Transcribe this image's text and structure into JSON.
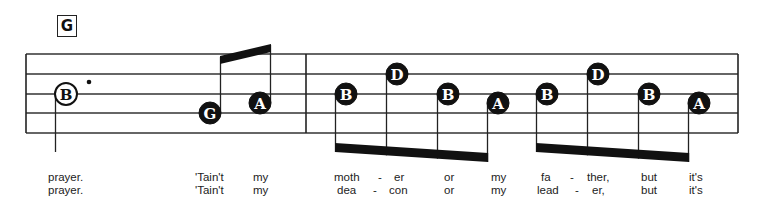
{
  "chord": {
    "label": "G"
  },
  "staff": {
    "lines_y": [
      54,
      74,
      94,
      113,
      133
    ],
    "left_x": 26,
    "barline_x": 306,
    "right_x": 738,
    "color": "#333333"
  },
  "notes": [
    {
      "letter": "B",
      "x": 66,
      "y": 94,
      "filled": false,
      "dotted": true,
      "stem": "down"
    },
    {
      "letter": "G",
      "x": 210,
      "y": 113,
      "filled": true,
      "stem": "up"
    },
    {
      "letter": "A",
      "x": 260,
      "y": 103,
      "filled": true,
      "stem": "up"
    },
    {
      "letter": "B",
      "x": 346,
      "y": 94,
      "filled": true,
      "stem": "down"
    },
    {
      "letter": "D",
      "x": 397,
      "y": 74,
      "filled": true,
      "stem": "down"
    },
    {
      "letter": "B",
      "x": 448,
      "y": 94,
      "filled": true,
      "stem": "down"
    },
    {
      "letter": "A",
      "x": 498,
      "y": 103,
      "filled": true,
      "stem": "down"
    },
    {
      "letter": "B",
      "x": 547,
      "y": 94,
      "filled": true,
      "stem": "down"
    },
    {
      "letter": "D",
      "x": 598,
      "y": 74,
      "filled": true,
      "stem": "down"
    },
    {
      "letter": "B",
      "x": 649,
      "y": 94,
      "filled": true,
      "stem": "down"
    },
    {
      "letter": "A",
      "x": 699,
      "y": 103,
      "filled": true,
      "stem": "down"
    }
  ],
  "lyrics": {
    "line1": [
      {
        "text": "prayer.",
        "x": 48
      },
      {
        "text": "'Tain't",
        "x": 195
      },
      {
        "text": "my",
        "x": 253
      },
      {
        "text": "moth",
        "x": 334
      },
      {
        "text": "-",
        "x": 378
      },
      {
        "text": "er",
        "x": 394
      },
      {
        "text": "or",
        "x": 444
      },
      {
        "text": "my",
        "x": 491
      },
      {
        "text": "fa",
        "x": 541
      },
      {
        "text": "-",
        "x": 570
      },
      {
        "text": "ther,",
        "x": 587
      },
      {
        "text": "but",
        "x": 641
      },
      {
        "text": "it's",
        "x": 689
      }
    ],
    "line2": [
      {
        "text": "prayer.",
        "x": 48
      },
      {
        "text": "'Tain't",
        "x": 195
      },
      {
        "text": "my",
        "x": 253
      },
      {
        "text": "dea",
        "x": 337
      },
      {
        "text": "-",
        "x": 373
      },
      {
        "text": "con",
        "x": 389
      },
      {
        "text": "or",
        "x": 444
      },
      {
        "text": "my",
        "x": 491
      },
      {
        "text": "lead",
        "x": 537
      },
      {
        "text": "-",
        "x": 575
      },
      {
        "text": "er,",
        "x": 592
      },
      {
        "text": "but",
        "x": 641
      },
      {
        "text": "it's",
        "x": 689
      }
    ]
  }
}
